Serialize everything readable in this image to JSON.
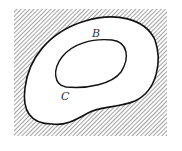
{
  "diagram": {
    "labels": {
      "inner_top": "B",
      "inner_left": "C"
    },
    "colors": {
      "stroke": "#111111",
      "hatch": "#7a7a7a",
      "background": "#ffffff"
    }
  }
}
